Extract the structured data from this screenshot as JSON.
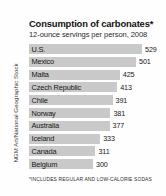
{
  "credit": "NGM Art/National Geographic Stock",
  "chart_data": {
    "type": "bar",
    "orientation": "horizontal",
    "title": "Consumption of carbonates*",
    "subtitle": "12-ounce servings per person, 2008",
    "footnote": "*INCLUDES REGULAR AND LOW-CALORIE SODAS",
    "xlabel": "",
    "ylabel": "",
    "xlim": [
      0,
      529
    ],
    "grid": false,
    "legend": false,
    "bar_color": "#c9c9c9",
    "categories": [
      "U.S.",
      "Mexico",
      "Malta",
      "Czech Republic",
      "Chile",
      "Norway",
      "Australia",
      "Iceland",
      "Canada",
      "Belgium"
    ],
    "values": [
      529,
      501,
      425,
      413,
      391,
      381,
      377,
      333,
      311,
      300
    ],
    "value_labels": [
      "529",
      "501",
      "425",
      "413",
      "391",
      "381",
      "377",
      "333",
      "311",
      "300"
    ]
  }
}
